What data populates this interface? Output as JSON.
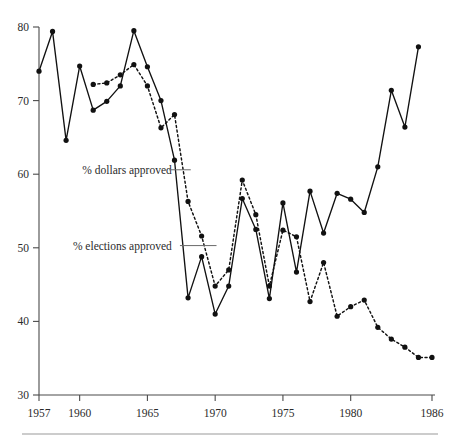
{
  "figure": {
    "name": "bond-referenda-approval-line-chart",
    "has_bottom_rule": true
  },
  "chart_data": {
    "type": "line",
    "title": "",
    "subtitle": "",
    "xlabel": "",
    "ylabel": "",
    "xlim": [
      1956.4,
      1986.6
    ],
    "ylim": [
      30,
      80
    ],
    "yticks": [
      30,
      40,
      50,
      60,
      70,
      80
    ],
    "ytick_labels": [
      "30",
      "40",
      "50",
      "60",
      "70",
      "80"
    ],
    "xticks": [
      1957,
      1960,
      1965,
      1970,
      1975,
      1980,
      1986
    ],
    "xtick_labels": [
      "1957",
      "1960",
      "1965",
      "1970",
      "1975",
      "1980",
      "1986"
    ],
    "grid": false,
    "legend_position": "inline-annotations",
    "annotations": [
      {
        "text": "% dollars approved",
        "series": "% dollars approved",
        "text_x": 1960.2,
        "text_y": 60.6,
        "leader_from_x": 1966.6,
        "leader_to_x": 1968.2,
        "leader_y": 60.6
      },
      {
        "text": "% elections approved",
        "series": "% elections approved",
        "text_x": 1959.5,
        "text_y": 50.3,
        "leader_from_x": 1967.4,
        "leader_to_x": 1970.1,
        "leader_y": 50.3
      }
    ],
    "series": [
      {
        "name": "% elections approved",
        "style": "solid",
        "marker": "circle",
        "x": [
          1957,
          1958,
          1959,
          1960,
          1961,
          1962,
          1963,
          1964,
          1965,
          1966,
          1967,
          1968,
          1969,
          1970,
          1971,
          1972,
          1973,
          1974,
          1975,
          1976,
          1977,
          1978,
          1979,
          1980,
          1981,
          1982,
          1983,
          1984,
          1985,
          1986
        ],
        "y": [
          74.0,
          79.4,
          64.6,
          74.7,
          68.7,
          69.9,
          72.0,
          79.5,
          74.6,
          70.0,
          61.9,
          43.2,
          48.8,
          41.0,
          44.8,
          56.7,
          52.5,
          43.1,
          56.1,
          46.7,
          57.7,
          52.0,
          57.4,
          56.6,
          54.8,
          61.0,
          71.4,
          66.4,
          77.3,
          77.3
        ],
        "y_visible_count": 29
      },
      {
        "name": "% dollars approved",
        "style": "dotted",
        "marker": "circle",
        "x": [
          1961,
          1962,
          1963,
          1964,
          1965,
          1966,
          1967,
          1968,
          1969,
          1970,
          1971,
          1972,
          1973,
          1974,
          1975,
          1976,
          1977,
          1978,
          1979,
          1980,
          1981,
          1982,
          1983,
          1984,
          1985,
          1986
        ],
        "y": [
          72.2,
          72.4,
          73.5,
          74.9,
          72.0,
          66.3,
          68.1,
          56.3,
          51.6,
          44.8,
          47.0,
          59.2,
          54.5,
          44.8,
          52.4,
          51.5,
          42.7,
          48.0,
          40.7,
          42.0,
          42.9,
          39.2,
          37.6,
          36.5,
          35.1,
          35.1
        ]
      }
    ]
  },
  "axes": {
    "y_axis_name": "percent-approved",
    "x_axis_name": "year"
  }
}
